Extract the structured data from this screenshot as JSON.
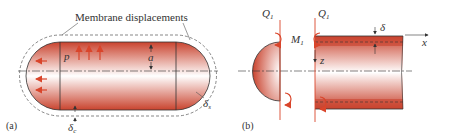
{
  "panel_a": {
    "label": "(a)",
    "title": "Membrane displacements",
    "pressure": "p",
    "radius": "a",
    "delta_c": "δ",
    "delta_c_sub": "c",
    "delta_s": "δ",
    "delta_s_sub": "s"
  },
  "panel_b": {
    "label": "(b)",
    "shear_left": "Q",
    "shear_left_sub": "1",
    "shear_right": "Q",
    "shear_right_sub": "1",
    "moment": "M",
    "moment_sub": "1",
    "thickness": "δ",
    "axis_x": "x",
    "axis_z": "z"
  },
  "colors": {
    "shell_dark": "#c0392b",
    "shell_light": "#ffffff",
    "arrow": "#d9452b",
    "dash": "#555555",
    "line": "#333333"
  }
}
